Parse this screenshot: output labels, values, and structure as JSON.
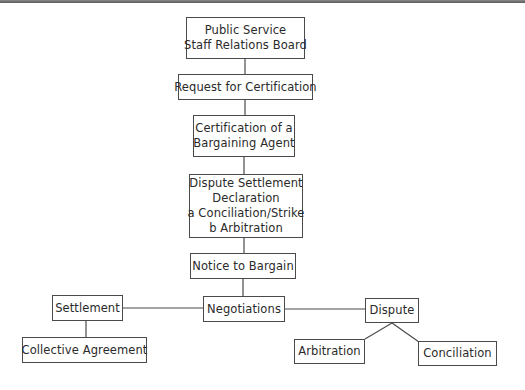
{
  "diagram": {
    "type": "flowchart",
    "nodes": {
      "board": {
        "lines": [
          "Public Service",
          "Staff Relations Board"
        ]
      },
      "request": {
        "lines": [
          "Request for Certification"
        ]
      },
      "certification": {
        "lines": [
          "Certification of a",
          "Bargaining Agent"
        ]
      },
      "dispute_declaration": {
        "lines": [
          "Dispute Settlement",
          "Declaration",
          "a Conciliation/Strike",
          "b Arbitration"
        ]
      },
      "notice": {
        "lines": [
          "Notice to Bargain"
        ]
      },
      "negotiations": {
        "lines": [
          "Negotiations"
        ]
      },
      "settlement": {
        "lines": [
          "Settlement"
        ]
      },
      "collective_agreement": {
        "lines": [
          "Collective Agreement"
        ]
      },
      "dispute": {
        "lines": [
          "Dispute"
        ]
      },
      "arbitration": {
        "lines": [
          "Arbitration"
        ]
      },
      "conciliation": {
        "lines": [
          "Conciliation"
        ]
      }
    },
    "edges": [
      [
        "board",
        "request"
      ],
      [
        "request",
        "certification"
      ],
      [
        "certification",
        "dispute_declaration"
      ],
      [
        "dispute_declaration",
        "notice"
      ],
      [
        "notice",
        "negotiations"
      ],
      [
        "negotiations",
        "settlement"
      ],
      [
        "negotiations",
        "dispute"
      ],
      [
        "settlement",
        "collective_agreement"
      ],
      [
        "dispute",
        "arbitration"
      ],
      [
        "dispute",
        "conciliation"
      ]
    ]
  }
}
